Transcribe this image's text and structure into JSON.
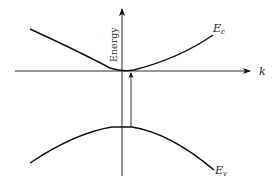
{
  "diagram": {
    "type": "band-structure",
    "axes": {
      "vertical_label": "Energy",
      "horizontal_label": "k"
    },
    "bands": [
      {
        "id": "conduction",
        "label_main": "E",
        "label_sub": "c",
        "shape": "parabola-up"
      },
      {
        "id": "valence",
        "label_main": "E",
        "label_sub": "v",
        "shape": "parabola-down"
      }
    ],
    "transition": {
      "description": "vertical arrow from valence band maximum to conduction band minimum",
      "direction": "up"
    },
    "colors": {
      "line": "#111111",
      "background": "#ffffff"
    }
  }
}
